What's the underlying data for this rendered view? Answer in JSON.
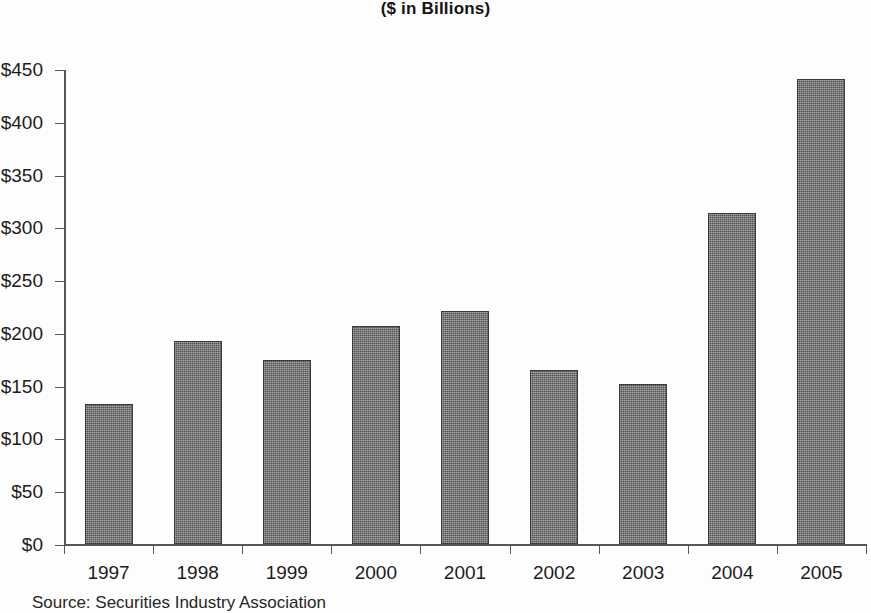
{
  "chart_data": {
    "type": "bar",
    "title": "($ in Billions)",
    "subtitle": "",
    "xlabel": "",
    "ylabel": "",
    "categories": [
      "1997",
      "1998",
      "1999",
      "2000",
      "2001",
      "2002",
      "2003",
      "2004",
      "2005"
    ],
    "values": [
      133,
      192,
      174,
      207,
      221,
      165,
      152,
      314,
      441
    ],
    "ylim": [
      0,
      450
    ],
    "ytick_values": [
      0,
      50,
      100,
      150,
      200,
      250,
      300,
      350,
      400,
      450
    ],
    "ytick_labels": [
      "$0",
      "$50",
      "$100",
      "$150",
      "$200",
      "$250",
      "$300",
      "$350",
      "$400",
      "$450"
    ],
    "grid": false,
    "legend": false,
    "legend_position": "none",
    "bar_color": "#6e6e6e",
    "bar_edge_color": "#3a3a3a",
    "axis_color": "#555555",
    "background_color": "#fdfdfd"
  },
  "footer": {
    "source_note": "Source: Securities Industry Association"
  }
}
